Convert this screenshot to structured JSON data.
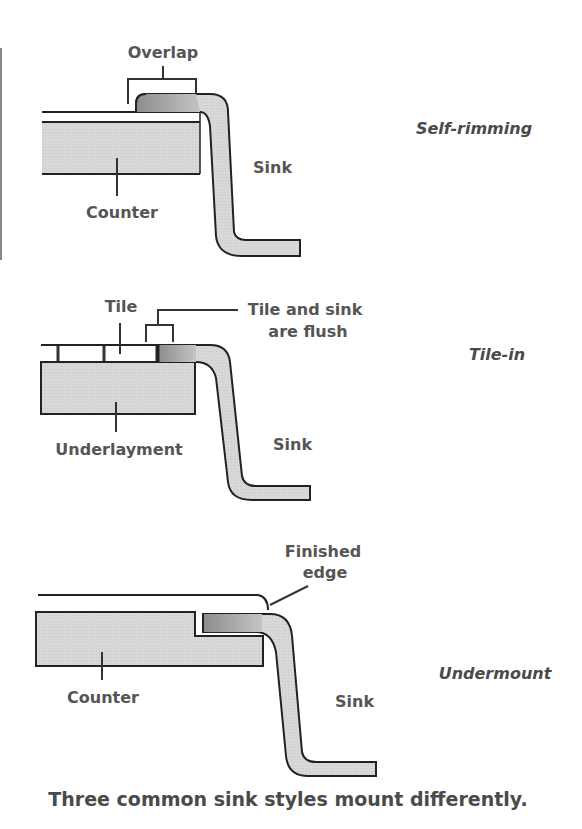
{
  "colors": {
    "outline": "#222222",
    "counter_fill": "#dcdcdc",
    "sink_fill": "#c9c9c9",
    "rim_fill": "#9a9a9a",
    "text": "#555555"
  },
  "diagrams": [
    {
      "style_name": "Self-rimming",
      "labels": {
        "overlap": "Overlap",
        "sink": "Sink",
        "counter": "Counter"
      }
    },
    {
      "style_name": "Tile-in",
      "labels": {
        "tile": "Tile",
        "flush_line1": "Tile and sink",
        "flush_line2": "are flush",
        "underlayment": "Underlayment",
        "sink": "Sink"
      }
    },
    {
      "style_name": "Undermount",
      "labels": {
        "finished_line1": "Finished",
        "finished_line2": "edge",
        "counter": "Counter",
        "sink": "Sink"
      }
    }
  ],
  "caption": "Three common sink styles mount differently."
}
